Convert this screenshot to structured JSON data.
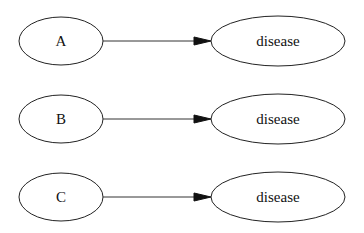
{
  "diagram": {
    "type": "directed-graph",
    "nodes": [
      {
        "id": "A",
        "label": "A"
      },
      {
        "id": "B",
        "label": "B"
      },
      {
        "id": "C",
        "label": "C"
      },
      {
        "id": "disease1",
        "label": "disease"
      },
      {
        "id": "disease2",
        "label": "disease"
      },
      {
        "id": "disease3",
        "label": "disease"
      }
    ],
    "edges": [
      {
        "from": "A",
        "to": "disease1"
      },
      {
        "from": "B",
        "to": "disease2"
      },
      {
        "from": "C",
        "to": "disease3"
      }
    ]
  }
}
